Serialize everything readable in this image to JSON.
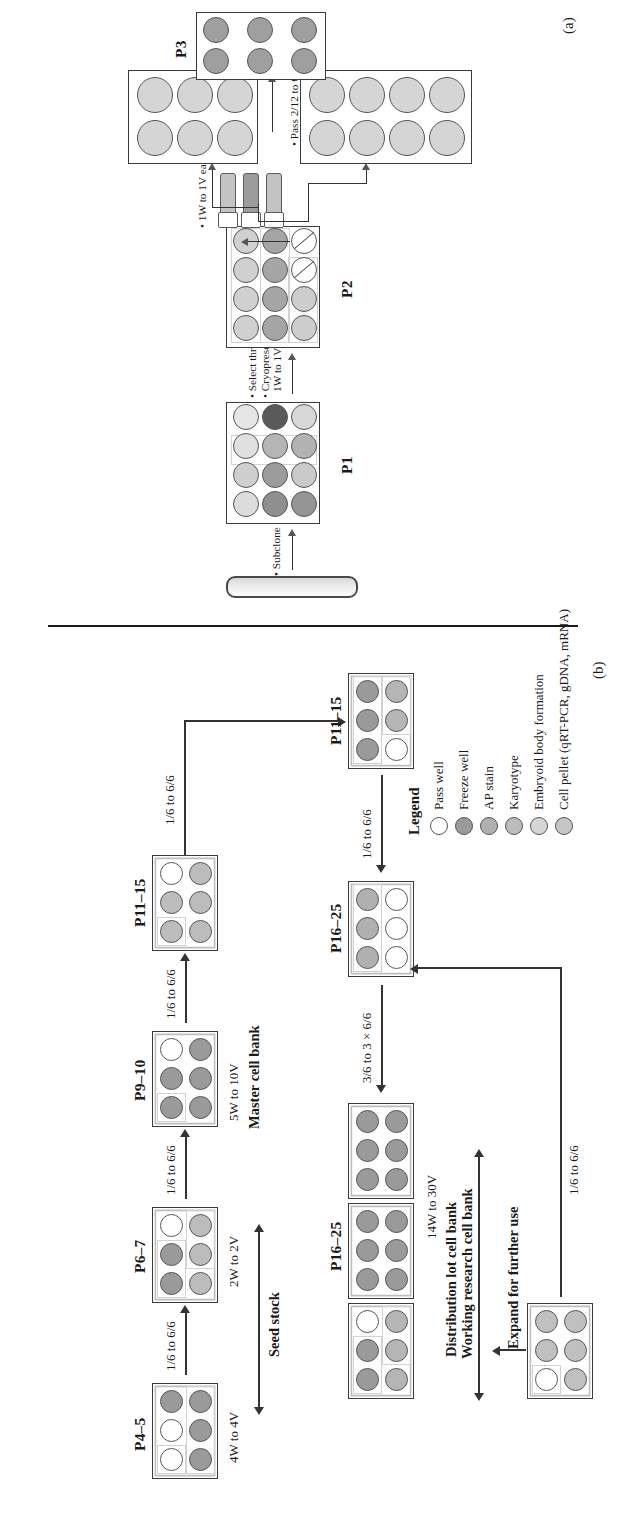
{
  "figure": {
    "panel_a_letter": "(a)",
    "panel_b_letter": "(b)"
  },
  "colors": {
    "pass_well": "#ffffff",
    "freeze_well": "#9a9a9a",
    "ap_stain": "#b0b0b0",
    "karyotype": "#bcbcbc",
    "embryoid_body": "#d4d4d4",
    "cell_pellet": "#c6c6c6",
    "outline": "#565656",
    "text": "#1a1a1a"
  },
  "legend": {
    "title": "Legend",
    "items": [
      {
        "label": "Pass well",
        "color": "#ffffff"
      },
      {
        "label": "Freeze well",
        "color": "#9a9a9a"
      },
      {
        "label": "AP stain",
        "color": "#b0b0b0"
      },
      {
        "label": "Karyotype",
        "color": "#bcbcbc"
      },
      {
        "label": "Embryoid body formation",
        "color": "#d6d6d6"
      },
      {
        "label": "Cell pellet (qRT-PCR, gDNA, mRNA)",
        "color": "#c6c6c6"
      }
    ]
  },
  "panel_a": {
    "dish_label": "",
    "steps": [
      "• Subclone single colonies",
      "• Select three clones. Pass 1/12 to 3/12",
      "• Cryopreserve remaining clones,",
      "  1W to 1V each",
      "• 1W to 1V each",
      "• Pass 2/12 to 6/6"
    ],
    "step_subclone": "• Subclone single colonies",
    "step_select": "• Select three clones. Pass 1/12 to 3/12",
    "step_cryo1": "• Cryopreserve remaining clones,",
    "step_cryo2": "1W to 1V each",
    "step_vials": "• 1W to 1V each",
    "step_pass": "• Pass 2/12 to 6/6",
    "plates": [
      {
        "name": "P1",
        "label": "P1",
        "rows": 4,
        "cols": 3
      },
      {
        "name": "P2",
        "label": "P2",
        "rows": 4,
        "cols": 3
      },
      {
        "name": "P3",
        "label": "P3",
        "rows": 3,
        "cols": 2
      }
    ],
    "p1_label": "P1",
    "p2_label": "P2",
    "p3_label": "P3"
  },
  "panel_b": {
    "plates": [
      {
        "label": "P4–5"
      },
      {
        "label": "P6–7"
      },
      {
        "label": "P9–10"
      },
      {
        "label": "P11–15"
      },
      {
        "label": "P11–15"
      },
      {
        "label": "P16–25"
      },
      {
        "label": "P16–25"
      }
    ],
    "p4_5_label": "P4–5",
    "p6_7_label": "P6–7",
    "p9_10_label": "P9–10",
    "p11_15_top_label": "P11–15",
    "p11_15_bottom_label": "P11–15",
    "p16_25_mid_label": "P16–25",
    "p16_25_bank_label": "P16–25",
    "transitions": {
      "t1": "1/6 to 6/6",
      "t2": "1/6 to 6/6",
      "t3": "1/6 to 6/6",
      "t4": "1/6 to 6/6",
      "t5": "1/6 to 6/6",
      "t6": "3/6 to 3 × 6/6",
      "t7": "1/6 to 6/6"
    },
    "banks": {
      "seed_stock": "Seed stock",
      "seed_stock_vials": "4W to 4V",
      "seed_stock_vials2": "2W to 2V",
      "master_cell_bank": "Master cell bank",
      "master_cell_bank_vials": "5W to 10V",
      "distribution_lot": "Distribution lot cell bank",
      "working_research": "Working research cell bank",
      "working_vials": "14W to 30V",
      "expand": "Expand for further use"
    }
  }
}
